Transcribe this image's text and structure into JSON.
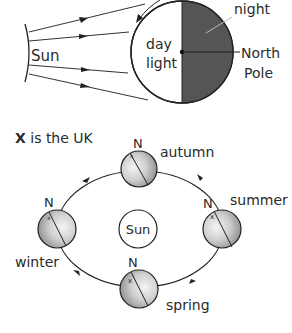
{
  "top_diagram": {
    "sun_label": "Sun",
    "day_label_1": "day",
    "day_label_2": "light",
    "night_label": "night",
    "north_pole_label_1": "North",
    "north_pole_label_2": "Pole",
    "colors": {
      "night": "#555555",
      "day": "#ffffff",
      "stroke": "#222222"
    }
  },
  "bottom_diagram": {
    "legend_x": "X",
    "legend_text": " is the UK",
    "sun_label": "Sun",
    "north_marker": "N",
    "uk_marker": "x",
    "seasons": {
      "autumn": "autumn",
      "summer": "summer",
      "winter": "winter",
      "spring": "spring"
    }
  }
}
